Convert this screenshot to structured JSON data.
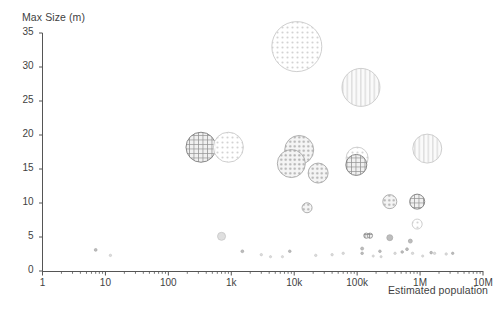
{
  "chart_data": {
    "type": "scatter",
    "title": "",
    "xlabel": "Estimated population",
    "ylabel": "Max Size (m)",
    "xscale": "log",
    "yscale": "linear",
    "xlim": [
      1,
      10000000
    ],
    "ylim": [
      0,
      35
    ],
    "grid": false,
    "legend": null,
    "x_tick_labels": [
      "1",
      "10",
      "100",
      "1k",
      "10k",
      "100k",
      "1M",
      "10M"
    ],
    "x_tick_values": [
      1,
      10,
      100,
      1000,
      10000,
      100000,
      1000000,
      10000000
    ],
    "y_tick_labels": [
      "0",
      "5",
      "10",
      "15",
      "20",
      "25",
      "30",
      "35"
    ],
    "y_tick_values": [
      0,
      5,
      10,
      15,
      20,
      25,
      30,
      35
    ],
    "marker_shape": "circle",
    "note": "Bubble size encodes a third magnitude variable; fills are hatch/dot patterns in grey.",
    "points": [
      {
        "x": 11000,
        "y": 33.0,
        "r": 25.0,
        "pattern": "dots",
        "tone": "light"
      },
      {
        "x": 115000,
        "y": 27.0,
        "r": 19.0,
        "pattern": "vlines",
        "tone": "light"
      },
      {
        "x": 330,
        "y": 18.2,
        "r": 15.0,
        "pattern": "grid",
        "tone": "dark"
      },
      {
        "x": 900,
        "y": 18.2,
        "r": 15.0,
        "pattern": "dots",
        "tone": "light"
      },
      {
        "x": 1300000,
        "y": 18.0,
        "r": 14.5,
        "pattern": "vlines",
        "tone": "light"
      },
      {
        "x": 12000,
        "y": 17.8,
        "r": 14.5,
        "pattern": "dots",
        "tone": "mid"
      },
      {
        "x": 9000,
        "y": 15.8,
        "r": 14.0,
        "pattern": "dots",
        "tone": "mid"
      },
      {
        "x": 100000,
        "y": 16.6,
        "r": 11.0,
        "pattern": "dots",
        "tone": "light"
      },
      {
        "x": 97000,
        "y": 15.6,
        "r": 10.5,
        "pattern": "grid",
        "tone": "dark"
      },
      {
        "x": 24000,
        "y": 14.4,
        "r": 10.0,
        "pattern": "dots",
        "tone": "mid"
      },
      {
        "x": 16000,
        "y": 9.3,
        "r": 5.0,
        "pattern": "dots",
        "tone": "mid"
      },
      {
        "x": 330000,
        "y": 10.2,
        "r": 7.0,
        "pattern": "dots",
        "tone": "mid"
      },
      {
        "x": 900000,
        "y": 10.2,
        "r": 7.5,
        "pattern": "grid",
        "tone": "dark"
      },
      {
        "x": 900000,
        "y": 6.9,
        "r": 5.0,
        "pattern": "dots",
        "tone": "light"
      },
      {
        "x": 700,
        "y": 5.1,
        "r": 4.0,
        "pattern": "plain",
        "tone": "light"
      },
      {
        "x": 330000,
        "y": 4.9,
        "r": 3.0,
        "pattern": "plain",
        "tone": "mid"
      },
      {
        "x": 140000,
        "y": 5.2,
        "r": 2.6,
        "pattern": "grid",
        "tone": "dark"
      },
      {
        "x": 160000,
        "y": 5.2,
        "r": 2.6,
        "pattern": "grid",
        "tone": "dark"
      },
      {
        "x": 700000,
        "y": 4.4,
        "r": 2.0,
        "pattern": "plain",
        "tone": "mid"
      },
      {
        "x": 7,
        "y": 3.1,
        "r": 1.4,
        "pattern": "plain",
        "tone": "mid"
      },
      {
        "x": 12,
        "y": 2.3,
        "r": 1.2,
        "pattern": "plain",
        "tone": "light"
      },
      {
        "x": 1500,
        "y": 2.9,
        "r": 1.4,
        "pattern": "plain",
        "tone": "mid"
      },
      {
        "x": 3000,
        "y": 2.4,
        "r": 1.2,
        "pattern": "plain",
        "tone": "light"
      },
      {
        "x": 4200,
        "y": 2.1,
        "r": 1.1,
        "pattern": "plain",
        "tone": "light"
      },
      {
        "x": 6500,
        "y": 2.1,
        "r": 1.1,
        "pattern": "plain",
        "tone": "light"
      },
      {
        "x": 8500,
        "y": 2.9,
        "r": 1.3,
        "pattern": "plain",
        "tone": "mid"
      },
      {
        "x": 22000,
        "y": 2.3,
        "r": 1.2,
        "pattern": "plain",
        "tone": "light"
      },
      {
        "x": 120000,
        "y": 3.3,
        "r": 1.5,
        "pattern": "plain",
        "tone": "mid"
      },
      {
        "x": 120000,
        "y": 2.6,
        "r": 1.3,
        "pattern": "plain",
        "tone": "mid"
      },
      {
        "x": 180000,
        "y": 2.2,
        "r": 1.1,
        "pattern": "plain",
        "tone": "light"
      },
      {
        "x": 230000,
        "y": 2.9,
        "r": 1.3,
        "pattern": "plain",
        "tone": "mid"
      },
      {
        "x": 240000,
        "y": 2.1,
        "r": 1.1,
        "pattern": "plain",
        "tone": "light"
      },
      {
        "x": 400000,
        "y": 2.6,
        "r": 1.2,
        "pattern": "plain",
        "tone": "light"
      },
      {
        "x": 520000,
        "y": 2.8,
        "r": 1.3,
        "pattern": "plain",
        "tone": "mid"
      },
      {
        "x": 620000,
        "y": 3.2,
        "r": 1.4,
        "pattern": "plain",
        "tone": "mid"
      },
      {
        "x": 760000,
        "y": 2.6,
        "r": 1.2,
        "pattern": "plain",
        "tone": "light"
      },
      {
        "x": 1100000,
        "y": 2.2,
        "r": 1.1,
        "pattern": "plain",
        "tone": "light"
      },
      {
        "x": 1500000,
        "y": 2.7,
        "r": 1.3,
        "pattern": "plain",
        "tone": "mid"
      },
      {
        "x": 1700000,
        "y": 2.6,
        "r": 1.2,
        "pattern": "plain",
        "tone": "light"
      },
      {
        "x": 2600000,
        "y": 2.5,
        "r": 1.2,
        "pattern": "plain",
        "tone": "light"
      },
      {
        "x": 3300000,
        "y": 2.6,
        "r": 1.2,
        "pattern": "plain",
        "tone": "mid"
      },
      {
        "x": 40000,
        "y": 2.4,
        "r": 1.2,
        "pattern": "plain",
        "tone": "light"
      },
      {
        "x": 60000,
        "y": 2.6,
        "r": 1.2,
        "pattern": "plain",
        "tone": "light"
      }
    ]
  },
  "axis": {
    "y_title": "Max Size (m)",
    "x_title": "Estimated population"
  },
  "colors": {
    "axis": "#555555",
    "text": "#3f3f3f",
    "bubble_dark": "#8a8a8a",
    "bubble_mid": "#b0b0b0",
    "bubble_light": "#d3d3d3",
    "background": "#ffffff"
  }
}
